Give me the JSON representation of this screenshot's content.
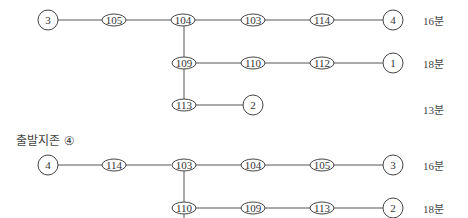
{
  "diagram_a": {
    "rows": [
      {
        "path": [
          "3",
          "105",
          "104",
          "103",
          "114",
          "4"
        ],
        "time": "16분"
      },
      {
        "path": [
          "104",
          "109",
          "110",
          "112",
          "1"
        ],
        "time": "18분"
      },
      {
        "path": [
          "109",
          "113",
          "2"
        ],
        "time": "13분"
      }
    ],
    "nodes": {
      "start": "3",
      "n105": "105",
      "n104": "104",
      "n103": "103",
      "n114": "114",
      "end4": "4",
      "n109": "109",
      "n110": "110",
      "n112": "112",
      "end1": "1",
      "n113": "113",
      "end2": "2"
    },
    "times": {
      "row1": "16분",
      "row2": "18분",
      "row3": "13분"
    }
  },
  "diagram_b": {
    "heading": "출발지존 ④",
    "rows": [
      {
        "path": [
          "4",
          "114",
          "103",
          "104",
          "105",
          "3"
        ],
        "time": "16분"
      },
      {
        "path": [
          "103",
          "110",
          "109",
          "113",
          "2"
        ],
        "time": "18분"
      }
    ],
    "nodes": {
      "start": "4",
      "n114": "114",
      "n103": "103",
      "n104": "104",
      "n105": "105",
      "end3": "3",
      "n110": "110",
      "n109": "109",
      "n113": "113",
      "end2": "2"
    },
    "times": {
      "row1": "16분",
      "row2": "18분"
    }
  }
}
